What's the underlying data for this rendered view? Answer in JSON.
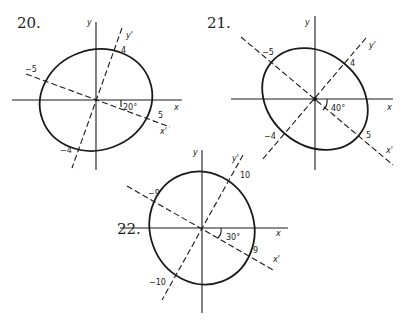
{
  "figures": [
    {
      "number": "20.",
      "axis_x": "x",
      "axis_y": "y",
      "axis_xp": "x'",
      "axis_yp": "y'",
      "angle": "20°",
      "vertex_pos": "5",
      "vertex_neg": "−5",
      "covertex_pos": "4",
      "covertex_neg": "−4"
    },
    {
      "number": "21.",
      "axis_x": "x",
      "axis_y": "y",
      "axis_xp": "x'",
      "axis_yp": "y'",
      "angle": "40°",
      "vertex_pos": "5",
      "vertex_neg": "−5",
      "covertex_pos": "4",
      "covertex_neg": "−4"
    },
    {
      "number": "22.",
      "axis_x": "x",
      "axis_y": "y",
      "axis_xp": "x'",
      "axis_yp": "y'",
      "angle": "30°",
      "vertex_pos": "9",
      "vertex_neg": "−9",
      "covertex_pos": "10",
      "covertex_neg": "−10"
    }
  ]
}
